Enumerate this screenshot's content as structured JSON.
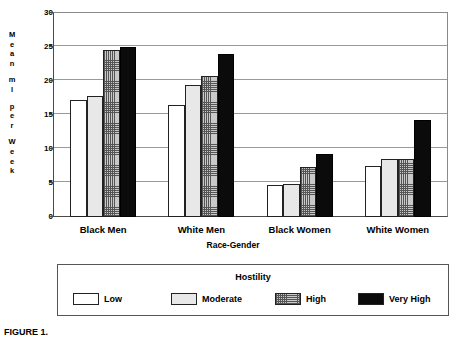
{
  "chart_data": {
    "type": "bar",
    "title": "",
    "xlabel": "Race-Gender",
    "ylabel": "Mean ml per Week",
    "categories": [
      "Black Men",
      "White Men",
      "Black Women",
      "White Women"
    ],
    "series": [
      {
        "name": "Low",
        "values": [
          17.2,
          16.5,
          4.7,
          7.5
        ],
        "swatch": "white"
      },
      {
        "name": "Moderate",
        "values": [
          17.8,
          19.4,
          4.8,
          8.6
        ],
        "swatch": "light-gray"
      },
      {
        "name": "High",
        "values": [
          24.5,
          20.8,
          7.4,
          8.6
        ],
        "swatch": "crosshatch"
      },
      {
        "name": "Very High",
        "values": [
          25.0,
          24.0,
          9.2,
          14.2
        ],
        "swatch": "black"
      }
    ],
    "ylim": [
      0,
      30
    ],
    "yticks": [
      0,
      5,
      10,
      15,
      20,
      25,
      30
    ],
    "ytick_labels": [
      "0",
      "5",
      "10",
      "15",
      "20",
      "25",
      "30"
    ],
    "grid": true,
    "grid_axis": "y",
    "legend_title": "Hostility",
    "legend_position": "bottom",
    "legend_entries": [
      "Low",
      "Moderate",
      "High",
      "Very High"
    ]
  },
  "yaxis": {
    "title_letters": [
      "M",
      "e",
      "a",
      "n",
      "",
      "m",
      "l",
      "",
      "p",
      "e",
      "r",
      "",
      "W",
      "e",
      "e",
      "k"
    ]
  },
  "legend": {
    "title": "Hostility",
    "items": [
      {
        "label": "Low"
      },
      {
        "label": "Moderate"
      },
      {
        "label": "High"
      },
      {
        "label": "Very High"
      }
    ]
  },
  "caption": {
    "figure_number": "FIGURE 1.",
    "text": ""
  },
  "colors": {
    "low": "#ffffff",
    "moderate": "#e8e8e8",
    "high": "#c9c9c9",
    "very_high": "#0b0b0b",
    "gridline": "#9a9a9a",
    "axis": "#4a4a4a"
  }
}
